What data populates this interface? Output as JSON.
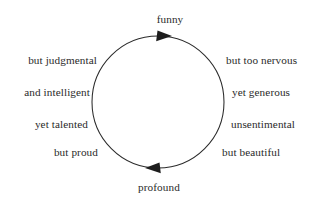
{
  "diagram": {
    "type": "cycle",
    "title_top": "funny",
    "title_bottom": "profound",
    "stroke_color": "#2b2b2b",
    "text_color": "#2a2a2a",
    "background_color": "#ffffff",
    "circle": {
      "center_x": 158,
      "center_y": 102,
      "radius": 66
    },
    "arrows": [
      {
        "name": "top-arrowhead",
        "direction": "right",
        "x": 163,
        "y": 36
      },
      {
        "name": "bottom-arrowhead",
        "direction": "left",
        "x": 154,
        "y": 168
      }
    ],
    "poles": {
      "top": {
        "label": "funny",
        "x": 170,
        "y": 13
      },
      "bottom": {
        "label": "profound",
        "x": 159,
        "y": 181
      }
    },
    "left_column": [
      {
        "label": "but judgmental",
        "x": 97,
        "y": 54
      },
      {
        "label": "and intelligent",
        "x": 90,
        "y": 86
      },
      {
        "label": "yet talented",
        "x": 88,
        "y": 118
      },
      {
        "label": "but proud",
        "x": 98,
        "y": 146
      }
    ],
    "right_column": [
      {
        "label": "but too nervous",
        "x": 226,
        "y": 54
      },
      {
        "label": "yet generous",
        "x": 232,
        "y": 86
      },
      {
        "label": "unsentimental",
        "x": 231,
        "y": 118
      },
      {
        "label": "but beautiful",
        "x": 222,
        "y": 146
      }
    ]
  }
}
